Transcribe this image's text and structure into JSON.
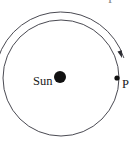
{
  "figure": {
    "name": "planetary-orbit-diagram",
    "width": 135,
    "height": 141,
    "background_color": "#ffffff",
    "stroke_color": "#4a4a52",
    "body_fill_color": "#111111",
    "text_color": "#1a1a1a"
  },
  "labels": {
    "sun": "Sun",
    "point_p": "P",
    "top_clipped_fragment": "P"
  },
  "geometry": {
    "orbit_circle": {
      "cx": 61,
      "cy": 78,
      "r": 58,
      "stroke_width": 1
    },
    "sun_body": {
      "cx": 60,
      "cy": 77,
      "r": 6
    },
    "point_p_marker": {
      "cx": 117,
      "cy": 78,
      "r": 2.6
    },
    "direction_arc": {
      "cx": 61,
      "cy": 78,
      "r": 66,
      "start_angle_deg": 197,
      "end_angle_deg": 342,
      "sweep": "clockwise",
      "stroke_width": 1
    },
    "arrow_head": {
      "x": 122,
      "y": 58,
      "angle_deg": 342
    }
  },
  "label_positions": {
    "sun": {
      "x": 33,
      "y": 85,
      "font_size": 12.5
    },
    "point_p": {
      "x": 122,
      "y": 88,
      "font_size": 12.5
    },
    "top_clipped_fragment": {
      "x": 108,
      "y": 3,
      "font_size": 12.5
    }
  },
  "chart_data": {
    "type": "diagram",
    "title": "",
    "annotations": [
      {
        "label": "Sun",
        "role": "central-body",
        "position": "center"
      },
      {
        "label": "P",
        "role": "orbit-point",
        "position": "right-of-circle"
      },
      {
        "label": "",
        "role": "direction-arrow",
        "position": "outer-arc-clockwise"
      }
    ]
  }
}
